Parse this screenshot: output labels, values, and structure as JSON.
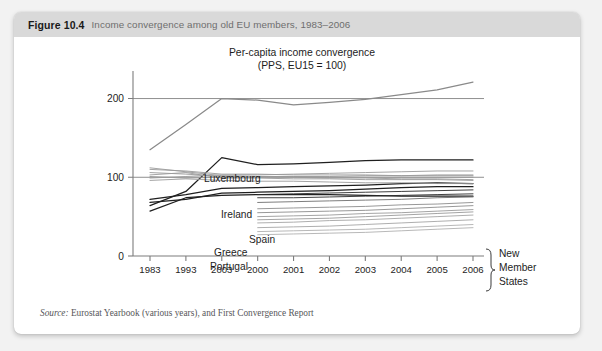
{
  "caption": {
    "number": "Figure 10.4",
    "text": "Income convergence among old EU members, 1983–2006"
  },
  "source": {
    "label": "Source:",
    "text": " Eurostat Yearbook (various years), and First Convergence Report"
  },
  "annotations": {
    "group_bracket_lines": [
      "New",
      "Member",
      "States"
    ]
  },
  "chart_data": {
    "type": "line",
    "title": "Per-capita income convergence\n(PPS, EU15 = 100)",
    "title_line1": "Per-capita income convergence",
    "title_line2": "(PPS, EU15 = 100)",
    "xlabel": "",
    "ylabel": "",
    "categories": [
      "1983",
      "1993",
      "2003",
      "2000",
      "2001",
      "2002",
      "2003",
      "2004",
      "2005",
      "2006"
    ],
    "ylim": [
      0,
      235
    ],
    "yticks": [
      0,
      100,
      200
    ],
    "grid": "horizontal-reference-lines-at-100-and-200",
    "legend": "inline-labels",
    "reference_lines": [
      {
        "name": "EU15 = 100",
        "value": 100,
        "color": "#8f8f8f"
      },
      {
        "name": "level-200",
        "value": 200,
        "color": "#8f8f8f"
      }
    ],
    "series": [
      {
        "name": "Luxembourg",
        "color": "#8a8a8a",
        "labelled": true,
        "values": [
          135,
          167,
          200,
          198,
          192,
          195,
          199,
          205,
          211,
          221
        ]
      },
      {
        "name": "Ireland",
        "color": "#1f1f1f",
        "labelled": true,
        "values": [
          64,
          82,
          125,
          116,
          117,
          119,
          121,
          122,
          122,
          122
        ]
      },
      {
        "name": "Spain",
        "color": "#1f1f1f",
        "labelled": true,
        "values": [
          72,
          78,
          86,
          87,
          88,
          89,
          90,
          92,
          93,
          92
        ]
      },
      {
        "name": "Greece",
        "color": "#1f1f1f",
        "labelled": true,
        "values": [
          68,
          72,
          80,
          81,
          82,
          83,
          85,
          87,
          88,
          88
        ]
      },
      {
        "name": "Portugal",
        "color": "#1f1f1f",
        "labelled": true,
        "values": [
          57,
          74,
          77,
          78,
          78,
          78,
          77,
          76,
          76,
          76
        ]
      },
      {
        "name": "eu15-a",
        "color": "#9a9a9a",
        "labelled": false,
        "values": [
          110,
          108,
          104,
          104,
          103,
          103,
          103,
          102,
          102,
          102
        ]
      },
      {
        "name": "eu15-b",
        "color": "#9a9a9a",
        "labelled": false,
        "values": [
          106,
          104,
          101,
          101,
          101,
          100,
          100,
          100,
          100,
          100
        ]
      },
      {
        "name": "eu15-c",
        "color": "#9a9a9a",
        "labelled": false,
        "values": [
          103,
          106,
          99,
          99,
          98,
          98,
          97,
          97,
          97,
          96
        ]
      },
      {
        "name": "eu15-d",
        "color": "#9a9a9a",
        "labelled": false,
        "values": [
          99,
          101,
          103,
          103,
          104,
          105,
          106,
          107,
          108,
          108
        ]
      },
      {
        "name": "eu15-e",
        "color": "#9a9a9a",
        "labelled": false,
        "values": [
          96,
          98,
          96,
          95,
          95,
          94,
          93,
          93,
          92,
          92
        ]
      },
      {
        "name": "eu15-f",
        "color": "#9a9a9a",
        "labelled": false,
        "values": [
          112,
          107,
          102,
          101,
          100,
          99,
          99,
          98,
          98,
          97
        ]
      },
      {
        "name": "eu15-g",
        "color": "#9a9a9a",
        "labelled": false,
        "values": [
          101,
          99,
          100,
          100,
          101,
          101,
          102,
          102,
          103,
          103
        ]
      },
      {
        "name": "nms-1",
        "color": "#2a2a2a",
        "labelled": false,
        "start_index": 3,
        "values": [
          null,
          null,
          null,
          78,
          79,
          80,
          81,
          82,
          83,
          84
        ]
      },
      {
        "name": "nms-2",
        "color": "#2a2a2a",
        "labelled": false,
        "start_index": 3,
        "values": [
          null,
          null,
          null,
          74,
          74,
          75,
          76,
          77,
          78,
          79
        ]
      },
      {
        "name": "nms-3",
        "color": "#6e6e6e",
        "labelled": false,
        "start_index": 3,
        "values": [
          null,
          null,
          null,
          68,
          69,
          70,
          71,
          72,
          74,
          75
        ]
      },
      {
        "name": "nms-4",
        "color": "#8c8c8c",
        "labelled": false,
        "start_index": 3,
        "values": [
          null,
          null,
          null,
          60,
          61,
          62,
          63,
          65,
          66,
          68
        ]
      },
      {
        "name": "nms-5",
        "color": "#8c8c8c",
        "labelled": false,
        "start_index": 3,
        "values": [
          null,
          null,
          null,
          55,
          56,
          57,
          58,
          60,
          62,
          64
        ]
      },
      {
        "name": "nms-6",
        "color": "#9a9a9a",
        "labelled": false,
        "start_index": 3,
        "values": [
          null,
          null,
          null,
          50,
          51,
          52,
          54,
          55,
          57,
          59
        ]
      },
      {
        "name": "nms-7",
        "color": "#9a9a9a",
        "labelled": false,
        "start_index": 3,
        "values": [
          null,
          null,
          null,
          46,
          47,
          48,
          50,
          52,
          54,
          56
        ]
      },
      {
        "name": "nms-8",
        "color": "#a5a5a5",
        "labelled": false,
        "start_index": 3,
        "values": [
          null,
          null,
          null,
          42,
          43,
          45,
          46,
          48,
          50,
          52
        ]
      },
      {
        "name": "nms-9",
        "color": "#a5a5a5",
        "labelled": false,
        "start_index": 3,
        "values": [
          null,
          null,
          null,
          36,
          37,
          38,
          40,
          42,
          44,
          46
        ]
      },
      {
        "name": "nms-10",
        "color": "#b0b0b0",
        "labelled": false,
        "start_index": 3,
        "values": [
          null,
          null,
          null,
          31,
          32,
          33,
          34,
          36,
          38,
          40
        ]
      },
      {
        "name": "nms-11",
        "color": "#b0b0b0",
        "labelled": false,
        "start_index": 3,
        "values": [
          null,
          null,
          null,
          27,
          28,
          29,
          30,
          32,
          34,
          36
        ]
      }
    ],
    "series_label_positions": [
      {
        "name": "Luxembourg",
        "x": 190,
        "y": 145
      },
      {
        "name": "Ireland",
        "x": 207,
        "y": 181
      },
      {
        "name": "Spain",
        "x": 235,
        "y": 206
      },
      {
        "name": "Greece",
        "x": 200,
        "y": 219
      },
      {
        "name": "Portugal",
        "x": 196,
        "y": 233
      }
    ]
  }
}
